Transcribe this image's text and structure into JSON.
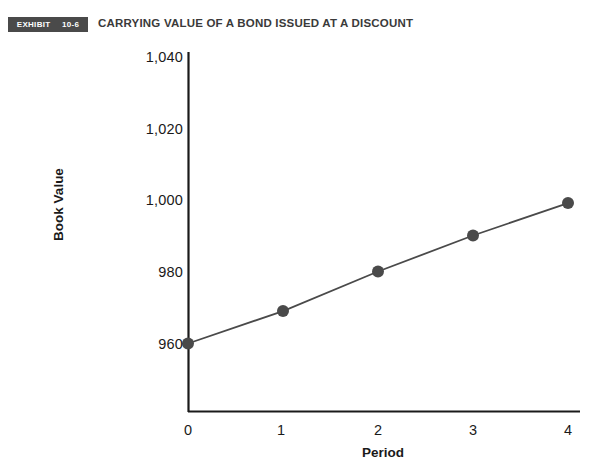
{
  "exhibit": {
    "label": "EXHIBIT",
    "number": "10-6"
  },
  "title": "CARRYING VALUE OF A BOND ISSUED AT A DISCOUNT",
  "colors": {
    "badge_background": "#4a4a4a",
    "badge_text": "#ffffff",
    "title_text": "#3a3a3a",
    "axis": "#1a1a1a",
    "series_line": "#4a4a4a",
    "marker": "#4a4a4a",
    "background": "#ffffff"
  },
  "chart_data": {
    "type": "line",
    "title": "CARRYING VALUE OF A BOND ISSUED AT A DISCOUNT",
    "xlabel": "Period",
    "ylabel": "Book Value",
    "x": [
      0,
      1,
      2,
      3,
      4
    ],
    "values": [
      960,
      969,
      980,
      990,
      999
    ],
    "series": [
      {
        "name": "Book Value",
        "values": [
          960,
          969,
          980,
          990,
          999
        ]
      }
    ],
    "xtick_labels": [
      "0",
      "1",
      "2",
      "3",
      "4"
    ],
    "ytick_labels": [
      "960",
      "980",
      "1,000",
      "1,020",
      "1,040"
    ],
    "ytick_values": [
      960,
      980,
      1000,
      1020,
      1040
    ],
    "xlim": [
      0,
      4.35
    ],
    "ylim": [
      940,
      1046
    ],
    "grid": false,
    "legend": false,
    "markers": true,
    "marker_shape": "circle"
  }
}
